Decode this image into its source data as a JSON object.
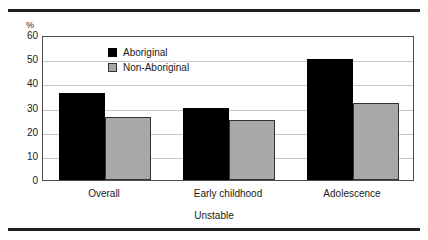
{
  "chart_data": {
    "type": "bar",
    "title": "",
    "subtitle": "",
    "xlabel": "Unstable",
    "ylabel": "%",
    "categories": [
      "Overall",
      "Early childhood",
      "Adolescence"
    ],
    "series": [
      {
        "name": "Aboriginal",
        "values": [
          36,
          30,
          50
        ],
        "color": "#000000"
      },
      {
        "name": "Non-Aboriginal",
        "values": [
          26,
          25,
          32
        ],
        "color": "#a8a8a8"
      }
    ],
    "ylim": [
      0,
      60
    ],
    "ytick_labels": [
      "0",
      "10",
      "20",
      "30",
      "40",
      "50",
      "60"
    ],
    "ytick_values": [
      0,
      10,
      20,
      30,
      40,
      50,
      60
    ],
    "grid": "horizontal",
    "legend_position": "inside-top-left"
  },
  "legend": {
    "entries": [
      {
        "label": "Aboriginal",
        "swatch": "black-square-swatch"
      },
      {
        "label": "Non-Aboriginal",
        "swatch": "gray-square-swatch"
      }
    ]
  },
  "axes": {
    "y_unit": "%",
    "x_title": "Unstable"
  }
}
